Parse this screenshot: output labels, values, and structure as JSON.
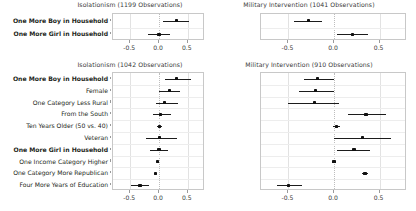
{
  "figure": {
    "kind": "coefficient-forest-plot",
    "width": 416,
    "height": 211,
    "background": "#ffffff",
    "point_color": "#111111",
    "line_color": "#1c1c1c",
    "grid_color": "#e2e2e2",
    "zero_line_color": "#bdbdbd"
  },
  "chart_data": [
    {
      "id": "top-left",
      "type": "scatter",
      "subtype": "coefficient-plot-with-error-bars",
      "title": "Isolationism (1199 Observations)",
      "observations": 1199,
      "xlabel": "",
      "ylabel": "",
      "xlim": [
        -0.8,
        0.8
      ],
      "xticks": [
        -0.5,
        0.0,
        0.5
      ],
      "xticklabels": [
        "-0.5",
        "0.0",
        "0.5"
      ],
      "grid": true,
      "zero_reference_line": 0.0,
      "legend": "none",
      "categories": [
        "One More Boy in Household",
        "One More Girl in Household"
      ],
      "bold_categories": [
        "One More Boy in Household",
        "One More Girl in Household"
      ],
      "points": [
        {
          "label": "One More Boy in Household",
          "estimate": 0.3,
          "low": 0.07,
          "high": 0.52
        },
        {
          "label": "One More Girl in Household",
          "estimate": 0.0,
          "low": -0.19,
          "high": 0.19
        }
      ]
    },
    {
      "id": "top-right",
      "type": "scatter",
      "subtype": "coefficient-plot-with-error-bars",
      "title": "Military Intervention (1041 Observations)",
      "observations": 1041,
      "xlabel": "",
      "ylabel": "",
      "xlim": [
        -0.8,
        0.8
      ],
      "xticks": [
        -0.5,
        0.0,
        0.5
      ],
      "xticklabels": [
        "-0.5",
        "0.0",
        "0.5"
      ],
      "grid": true,
      "zero_reference_line": 0.0,
      "legend": "none",
      "categories": [
        "One More Boy in Household",
        "One More Girl in Household"
      ],
      "bold_categories": [
        "One More Boy in Household",
        "One More Girl in Household"
      ],
      "points": [
        {
          "label": "One More Boy in Household",
          "estimate": -0.28,
          "low": -0.44,
          "high": -0.13
        },
        {
          "label": "One More Girl in Household",
          "estimate": 0.2,
          "low": 0.03,
          "high": 0.37
        }
      ]
    },
    {
      "id": "bottom-left",
      "type": "scatter",
      "subtype": "coefficient-plot-with-error-bars",
      "title": "Isolationism (1042 Observations)",
      "observations": 1042,
      "xlabel": "",
      "ylabel": "",
      "xlim": [
        -0.8,
        0.8
      ],
      "xticks": [
        -0.5,
        0.0,
        0.5
      ],
      "xticklabels": [
        "-0.5",
        "0.0",
        "0.5"
      ],
      "grid": true,
      "zero_reference_line": 0.0,
      "legend": "none",
      "categories": [
        "One More Boy in Household",
        "Female",
        "One Category Less Rural",
        "From the South",
        "Ten Years Older (50 vs. 40)",
        "Veteran",
        "One More Girl in Household",
        "One Income Category Higher",
        "One Category More Republican",
        "Four More Years of Education"
      ],
      "bold_categories": [
        "One More Boy in Household",
        "One More Girl in Household"
      ],
      "points": [
        {
          "label": "One More Boy in Household",
          "estimate": 0.3,
          "low": 0.11,
          "high": 0.56
        },
        {
          "label": "Female",
          "estimate": 0.18,
          "low": 0.0,
          "high": 0.36
        },
        {
          "label": "One Category Less Rural",
          "estimate": 0.09,
          "low": -0.05,
          "high": 0.33
        },
        {
          "label": "From the South",
          "estimate": 0.03,
          "low": -0.1,
          "high": 0.21
        },
        {
          "label": "Ten Years Older (50 vs. 40)",
          "estimate": 0.01,
          "low": -0.03,
          "high": 0.05
        },
        {
          "label": "Veteran",
          "estimate": 0.01,
          "low": -0.23,
          "high": 0.31
        },
        {
          "label": "One More Girl in Household",
          "estimate": 0.0,
          "low": -0.15,
          "high": 0.16
        },
        {
          "label": "One Income Category Higher",
          "estimate": -0.02,
          "low": -0.04,
          "high": 0.0
        },
        {
          "label": "One Category More Republican",
          "estimate": -0.06,
          "low": -0.09,
          "high": -0.03
        },
        {
          "label": "Four More Years of Education",
          "estimate": -0.33,
          "low": -0.48,
          "high": -0.17
        }
      ]
    },
    {
      "id": "bottom-right",
      "type": "scatter",
      "subtype": "coefficient-plot-with-error-bars",
      "title": "Military Intervention (910 Observations)",
      "observations": 910,
      "xlabel": "",
      "ylabel": "",
      "xlim": [
        -0.8,
        0.8
      ],
      "xticks": [
        -0.5,
        0.0,
        0.5
      ],
      "xticklabels": [
        "-0.5",
        "0.0",
        "0.5"
      ],
      "grid": true,
      "zero_reference_line": 0.0,
      "legend": "none",
      "categories": [
        "One More Boy in Household",
        "Female",
        "One Category Less Rural",
        "From the South",
        "Ten Years Older (50 vs. 40)",
        "Veteran",
        "One More Girl in Household",
        "One Income Category Higher",
        "One Category More Republican",
        "Four More Years of Education"
      ],
      "bold_categories": [
        "One More Boy in Household",
        "One More Girl in Household"
      ],
      "points": [
        {
          "label": "One More Boy in Household",
          "estimate": -0.18,
          "low": -0.33,
          "high": 0.0
        },
        {
          "label": "Female",
          "estimate": -0.2,
          "low": -0.38,
          "high": 0.0
        },
        {
          "label": "One Category Less Rural",
          "estimate": -0.21,
          "low": -0.5,
          "high": 0.05
        },
        {
          "label": "From the South",
          "estimate": 0.35,
          "low": 0.15,
          "high": 0.57
        },
        {
          "label": "Ten Years Older (50 vs. 40)",
          "estimate": 0.03,
          "low": -0.01,
          "high": 0.07
        },
        {
          "label": "Veteran",
          "estimate": 0.31,
          "low": 0.0,
          "high": 0.63
        },
        {
          "label": "One More Girl in Household",
          "estimate": 0.22,
          "low": 0.03,
          "high": 0.4
        },
        {
          "label": "One Income Category Higher",
          "estimate": 0.0,
          "low": -0.02,
          "high": 0.02
        },
        {
          "label": "One Category More Republican",
          "estimate": 0.34,
          "low": 0.31,
          "high": 0.37
        },
        {
          "label": "Four More Years of Education",
          "estimate": -0.5,
          "low": -0.63,
          "high": -0.35
        }
      ]
    }
  ]
}
